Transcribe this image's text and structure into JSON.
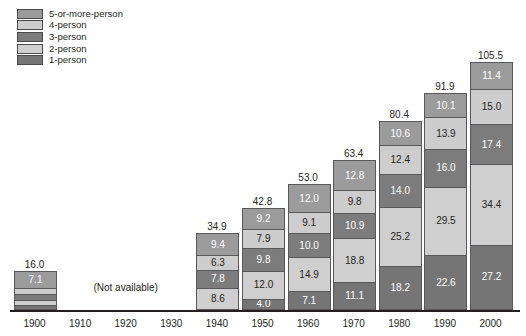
{
  "chart_data": {
    "type": "bar",
    "subtype": "stacked-bar",
    "title": "",
    "xlabel": "",
    "ylabel": "",
    "grid": false,
    "legend_position": "top-left",
    "categories": [
      "1900",
      "1910",
      "1920",
      "1930",
      "1940",
      "1950",
      "1960",
      "1970",
      "1980",
      "1990",
      "2000"
    ],
    "not_available_note": "(Not available)",
    "not_available_categories": [
      "1910",
      "1920",
      "1930"
    ],
    "totals": {
      "1900": "16.0",
      "1910": null,
      "1920": null,
      "1930": null,
      "1940": "34.9",
      "1950": "42.8",
      "1960": "53.0",
      "1970": "63.4",
      "1980": "80.4",
      "1990": "91.9",
      "2000": "105.5"
    },
    "series": [
      {
        "name": "1-person",
        "color": "#757575",
        "label_color": "#ffffff",
        "values": [
          null,
          null,
          null,
          null,
          null,
          4.0,
          7.1,
          11.1,
          18.2,
          22.6,
          27.2
        ],
        "labels": [
          "",
          "",
          "",
          "",
          "",
          "4.0",
          "7.1",
          "11.1",
          "18.2",
          "22.6",
          "27.2"
        ]
      },
      {
        "name": "2-person",
        "color": "#cfcfcf",
        "label_color": "#231f20",
        "values": [
          null,
          null,
          null,
          null,
          8.6,
          12.0,
          14.9,
          18.8,
          25.2,
          29.5,
          34.4
        ],
        "labels": [
          "",
          "",
          "",
          "",
          "8.6",
          "12.0",
          "14.9",
          "18.8",
          "25.2",
          "29.5",
          "34.4"
        ]
      },
      {
        "name": "3-person",
        "color": "#7c7c7c",
        "label_color": "#ffffff",
        "values": [
          null,
          null,
          null,
          null,
          7.8,
          9.8,
          10.0,
          10.9,
          14.0,
          16.0,
          17.4
        ],
        "labels": [
          "",
          "",
          "",
          "",
          "7.8",
          "9.8",
          "10.0",
          "10.9",
          "14.0",
          "16.0",
          "17.4"
        ]
      },
      {
        "name": "4-person",
        "color": "#cdcdcd",
        "label_color": "#231f20",
        "values": [
          null,
          null,
          null,
          null,
          6.3,
          7.9,
          9.1,
          9.8,
          12.4,
          13.9,
          15.0
        ],
        "labels": [
          "",
          "",
          "",
          "",
          "6.3",
          "7.9",
          "9.1",
          "9.8",
          "12.4",
          "13.9",
          "15.0"
        ]
      },
      {
        "name": "5-or-more-person",
        "color": "#9b9b9b",
        "label_color": "#ffffff",
        "values": [
          7.1,
          null,
          null,
          null,
          9.4,
          9.2,
          12.0,
          12.8,
          10.6,
          10.1,
          11.4
        ],
        "labels": [
          "7.1",
          "",
          "",
          "",
          "9.4",
          "9.2",
          "12.0",
          "12.8",
          "10.6",
          "10.1",
          "11.4"
        ]
      }
    ],
    "bar_1900_segments": [
      {
        "name": "1-person",
        "color": "#757575",
        "value": 1.1,
        "label": ""
      },
      {
        "name": "2-person",
        "color": "#cfcfcf",
        "value": 2.3,
        "label": ""
      },
      {
        "name": "3-person",
        "color": "#7c7c7c",
        "value": 2.5,
        "label": ""
      },
      {
        "name": "4-person",
        "color": "#cdcdcd",
        "value": 2.8,
        "label": ""
      },
      {
        "name": "5-or-more-person",
        "color": "#9b9b9b",
        "value": 7.1,
        "label": "7.1"
      }
    ],
    "ylim": [
      0,
      105.5
    ]
  },
  "legend": {
    "items": [
      {
        "label": "5-or-more-person",
        "color": "#9b9b9b"
      },
      {
        "label": "4-person",
        "color": "#cdcdcd"
      },
      {
        "label": "3-person",
        "color": "#7c7c7c"
      },
      {
        "label": "2-person",
        "color": "#cfcfcf"
      },
      {
        "label": "1-person",
        "color": "#757575"
      }
    ]
  }
}
